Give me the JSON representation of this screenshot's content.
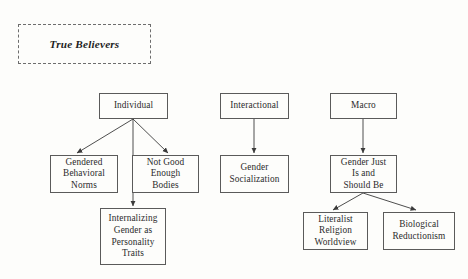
{
  "diagram": {
    "title_box": {
      "label": "True Believers"
    },
    "nodes": [
      {
        "id": "individual",
        "label": "Individual",
        "x": 99,
        "y": 93,
        "w": 69,
        "h": 26
      },
      {
        "id": "interactional",
        "label": "Interactional",
        "x": 220,
        "y": 93,
        "w": 69,
        "h": 26
      },
      {
        "id": "macro",
        "label": "Macro",
        "x": 330,
        "y": 93,
        "w": 67,
        "h": 26
      },
      {
        "id": "gendered-norms",
        "label": "Gendered\nBehavioral\nNorms",
        "x": 50,
        "y": 155,
        "w": 68,
        "h": 38
      },
      {
        "id": "not-good-bodies",
        "label": "Not Good\nEnough\nBodies",
        "x": 132,
        "y": 155,
        "w": 67,
        "h": 38
      },
      {
        "id": "gender-social",
        "label": "Gender\nSocialization",
        "x": 220,
        "y": 155,
        "w": 69,
        "h": 38
      },
      {
        "id": "gender-just-is",
        "label": "Gender Just\nIs and\nShould Be",
        "x": 330,
        "y": 155,
        "w": 67,
        "h": 38
      },
      {
        "id": "internalizing",
        "label": "Internalizing\nGender as\nPersonality\nTraits",
        "x": 100,
        "y": 208,
        "w": 66,
        "h": 57
      },
      {
        "id": "literalist",
        "label": "Literalist\nReligion\nWorldview",
        "x": 303,
        "y": 212,
        "w": 65,
        "h": 38
      },
      {
        "id": "biological",
        "label": "Biological\nReductionism",
        "x": 383,
        "y": 212,
        "w": 72,
        "h": 38
      }
    ],
    "edges": [
      {
        "from": "individual",
        "to": "gendered-norms",
        "x1": 133,
        "y1": 119,
        "x2": 77,
        "y2": 153
      },
      {
        "from": "individual",
        "to": "internalizing",
        "x1": 133,
        "y1": 119,
        "x2": 133,
        "y2": 206
      },
      {
        "from": "individual",
        "to": "not-good-bodies",
        "x1": 133,
        "y1": 119,
        "x2": 168,
        "y2": 153
      },
      {
        "from": "interactional",
        "to": "gender-social",
        "x1": 254,
        "y1": 119,
        "x2": 254,
        "y2": 153
      },
      {
        "from": "macro",
        "to": "gender-just-is",
        "x1": 363,
        "y1": 119,
        "x2": 363,
        "y2": 153
      },
      {
        "from": "gender-just-is",
        "to": "literalist",
        "x1": 363,
        "y1": 193,
        "x2": 333,
        "y2": 210
      },
      {
        "from": "gender-just-is",
        "to": "biological",
        "x1": 363,
        "y1": 193,
        "x2": 416,
        "y2": 210
      }
    ],
    "style": {
      "background": "#fdfdfb",
      "box_border": "#5a5a5a",
      "title_border": "#6d6d6d",
      "edge_color": "#3a3a3a",
      "text_color": "#2b2b2b"
    }
  }
}
